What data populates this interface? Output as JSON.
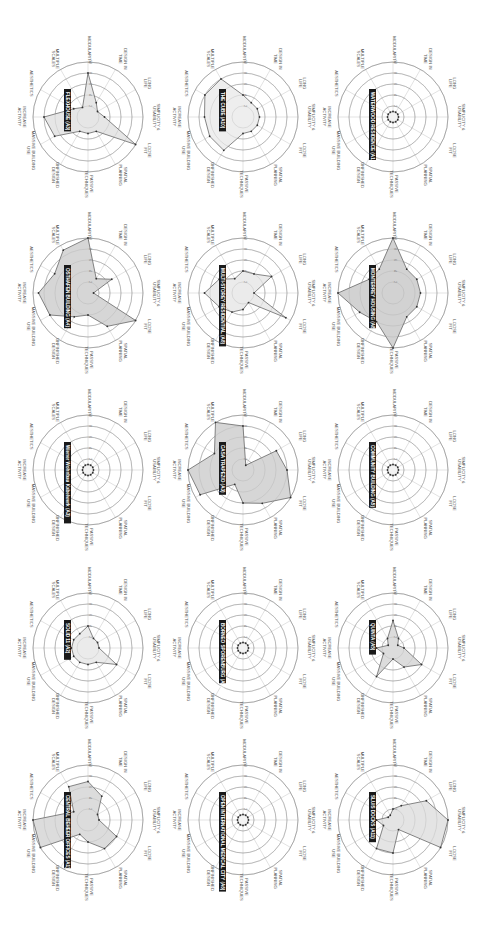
{
  "chart_data": {
    "type": "radar",
    "grid": {
      "rows": 5,
      "cols": 3,
      "orientation": "rotated 90deg clockwise"
    },
    "axes": [
      "SIMPLICITY & USABILITY",
      "LOOSE FIT",
      "SPATIAL PLANNING",
      "PASSIVE TECHNIQUES",
      "UNFINISHED DESIGN",
      "MASSIVE BUILDING USE",
      "INCREASE ACTIVITY",
      "AESTHETICS",
      "MULTIPLE SCALES",
      "MODULARITY",
      "DESIGN IN TIME",
      "LONG LIFE"
    ],
    "rings": [
      2,
      4,
      6,
      8,
      10
    ],
    "range": [
      0,
      10
    ],
    "charts": [
      {
        "title": "FLEXHOUSE (A3)",
        "row": 0,
        "col": 0,
        "cx": 88,
        "cy": 117,
        "fill": "#e6e6e6",
        "values": [
          3,
          10,
          3,
          3,
          3,
          7,
          8,
          3,
          2,
          8,
          3,
          2
        ]
      },
      {
        "title": "THE CUBE (A10)",
        "row": 0,
        "col": 1,
        "cx": 243,
        "cy": 117,
        "fill": "#eeeeee",
        "values": [
          3,
          3,
          3,
          3,
          7,
          7,
          7,
          8,
          8,
          4,
          3,
          3
        ]
      },
      {
        "title": "WATERWOOD RESIDENCE (A10)",
        "row": 0,
        "col": 2,
        "cx": 393,
        "cy": 117,
        "fill": "#f2f2f2",
        "values": [
          1,
          1,
          1,
          1,
          1,
          1,
          1,
          1,
          1,
          1,
          1,
          1
        ]
      },
      {
        "title": "OSTHAFEN BUILDING (A4)",
        "row": 1,
        "col": 0,
        "cx": 88,
        "cy": 293,
        "fill": "#d6d6d6",
        "values": [
          1,
          10,
          7,
          4,
          5,
          8,
          9,
          7,
          9,
          10,
          3,
          5
        ]
      },
      {
        "title": "MULTI-STOREY RESIDENTIAL (A8)",
        "row": 1,
        "col": 1,
        "cx": 243,
        "cy": 293,
        "fill": "#ebebeb",
        "values": [
          2,
          9,
          2,
          3,
          4,
          5,
          7,
          5,
          3,
          4,
          4,
          6
        ]
      },
      {
        "title": "MONTERREY HOUSING (A8)",
        "row": 1,
        "col": 2,
        "cx": 393,
        "cy": 293,
        "fill": "#d2d2d2",
        "values": [
          5,
          5,
          5,
          10,
          6,
          7,
          10,
          5,
          5,
          10,
          5,
          5
        ]
      },
      {
        "title": "Wiener Wohnbau Kabelwerk (A3)",
        "row": 2,
        "col": 0,
        "cx": 88,
        "cy": 470,
        "fill": "#f2f2f2",
        "values": [
          1,
          1,
          1,
          1,
          1,
          1,
          1,
          1,
          1,
          1,
          1,
          1
        ]
      },
      {
        "title": "CASA TRAPEZIO (A3)",
        "row": 2,
        "col": 1,
        "cx": 243,
        "cy": 470,
        "fill": "#d6d6d6",
        "values": [
          8,
          10,
          7,
          6,
          3,
          9,
          10,
          6,
          10,
          8,
          1,
          7
        ]
      },
      {
        "title": "COMMUNITY BUILDING (A5)",
        "row": 2,
        "col": 2,
        "cx": 393,
        "cy": 470,
        "fill": "#f2f2f2",
        "values": [
          1,
          1,
          1,
          1,
          1,
          1,
          1,
          1,
          1,
          1,
          1,
          1
        ]
      },
      {
        "title": "SOLID 11 (A2)",
        "row": 3,
        "col": 0,
        "cx": 88,
        "cy": 648,
        "fill": "#ebebeb",
        "values": [
          2,
          6,
          3,
          3,
          3,
          3,
          3,
          3,
          3,
          4,
          2,
          2
        ]
      },
      {
        "title": "BORNEO SPORENBURG (A2)",
        "row": 3,
        "col": 1,
        "cx": 243,
        "cy": 648,
        "fill": "#f2f2f2",
        "values": [
          1,
          1,
          1,
          1,
          1,
          1,
          1,
          1,
          1,
          1,
          1,
          1
        ]
      },
      {
        "title": "QUINTA (A5)",
        "row": 3,
        "col": 2,
        "cx": 393,
        "cy": 648,
        "fill": "#dcdcdc",
        "values": [
          2,
          6,
          4,
          2,
          6,
          2,
          3,
          1,
          2,
          5,
          2,
          1
        ]
      },
      {
        "title": "CENTRAL BEHEER OFFICES (A1)",
        "row": 4,
        "col": 0,
        "cx": 88,
        "cy": 820,
        "fill": "#dcdcdc",
        "values": [
          2,
          6,
          6,
          4,
          3,
          10,
          10,
          3,
          7,
          7,
          5,
          2
        ]
      },
      {
        "title": "OPEN INTERNATIONAL MEDICAL CITY (A6)",
        "row": 4,
        "col": 1,
        "cx": 243,
        "cy": 820,
        "fill": "#f4f4f4",
        "values": [
          1,
          1,
          1,
          1,
          1,
          1,
          1,
          1,
          1,
          1,
          1,
          1
        ]
      },
      {
        "title": "SLUIS DOCKS (A11)",
        "row": 4,
        "col": 2,
        "cx": 393,
        "cy": 820,
        "fill": "#e4e4e4",
        "values": [
          10,
          10,
          2,
          6,
          6,
          2,
          3,
          1,
          1,
          2,
          3,
          7
        ]
      }
    ]
  }
}
